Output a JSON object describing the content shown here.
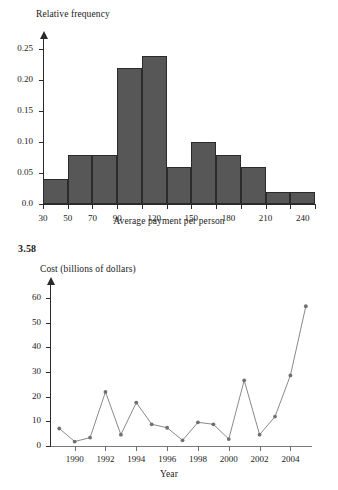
{
  "problem": {
    "number": "3.58"
  },
  "chart_data": [
    {
      "type": "bar",
      "name": "histogram-average-payment",
      "title": "",
      "ylabel": "Relative frequency",
      "xlabel": "Average payment per person",
      "ytick_labels": [
        "0.0",
        "0.05",
        "0.10",
        "0.15",
        "0.20",
        "0.25"
      ],
      "ytick_values": [
        0.0,
        0.05,
        0.1,
        0.15,
        0.2,
        0.25
      ],
      "ylim": [
        0,
        0.27
      ],
      "xlim": [
        30,
        250
      ],
      "xtick_labels": [
        "30",
        "50",
        "70",
        "90",
        "120",
        "150",
        "180",
        "210",
        "240"
      ],
      "xtick_values": [
        30,
        50,
        70,
        90,
        120,
        150,
        180,
        210,
        240
      ],
      "bin_edges": [
        30,
        50,
        70,
        90,
        110,
        130,
        150,
        170,
        190,
        210,
        230,
        250
      ],
      "values": [
        0.04,
        0.08,
        0.08,
        0.22,
        0.24,
        0.06,
        0.1,
        0.08,
        0.06,
        0.02,
        0.02
      ],
      "bar_color": "#575757",
      "bar_edge_color": "#2b2b2b",
      "grid": false,
      "legend": false
    },
    {
      "type": "line",
      "name": "line-cost-by-year",
      "title": "",
      "ylabel": "Cost (billions of dollars)",
      "xlabel": "Year",
      "ytick_labels": [
        "0",
        "10",
        "20",
        "30",
        "40",
        "50",
        "60"
      ],
      "ytick_values": [
        0,
        10,
        20,
        30,
        40,
        50,
        60
      ],
      "ylim": [
        0,
        66
      ],
      "xlim": [
        1988.4,
        2005.4
      ],
      "xtick_labels": [
        "1990",
        "1992",
        "1994",
        "1996",
        "1998",
        "2000",
        "2002",
        "2004"
      ],
      "xtick_values": [
        1990,
        1992,
        1994,
        1996,
        1998,
        2000,
        2002,
        2004
      ],
      "x": [
        1989,
        1990,
        1991,
        1992,
        1993,
        1994,
        1995,
        1996,
        1997,
        1998,
        1999,
        2000,
        2001,
        2002,
        2003,
        2004,
        2005
      ],
      "values": [
        7.5,
        2.2,
        3.8,
        22.3,
        5.0,
        18.0,
        9.2,
        7.8,
        2.7,
        10.0,
        9.2,
        3.2,
        27.0,
        5.0,
        12.3,
        29.0,
        57.0
      ],
      "line_color": "#8a8a8a",
      "marker_color": "#6f6f6f",
      "grid": false,
      "legend": false
    }
  ]
}
